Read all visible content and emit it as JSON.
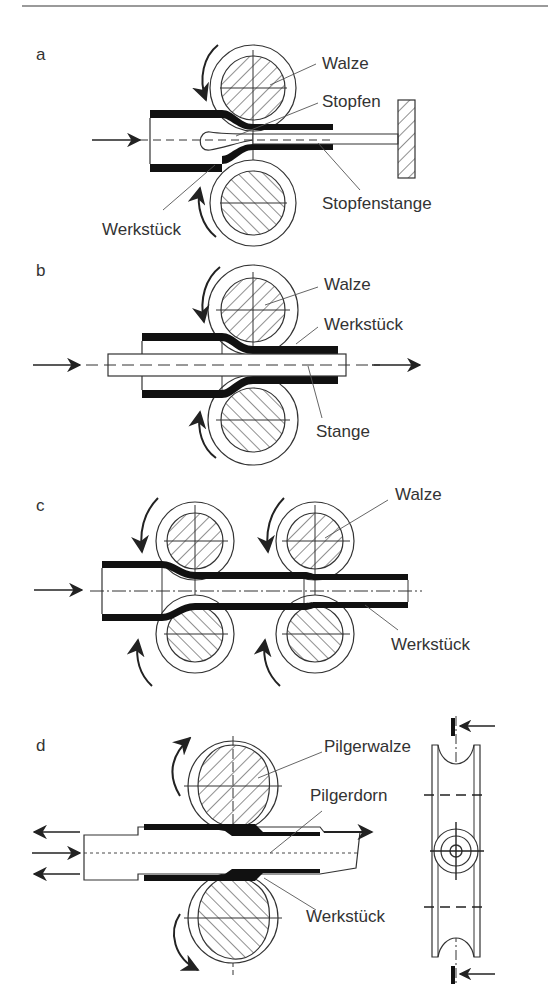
{
  "figure": {
    "panels": [
      {
        "id": "a",
        "label": "a",
        "callouts": {
          "roll": "Walze",
          "plug": "Stopfen",
          "plug_rod": "Stopfenstange",
          "workpiece": "Werkstück"
        }
      },
      {
        "id": "b",
        "label": "b",
        "callouts": {
          "roll": "Walze",
          "workpiece": "Werkstück",
          "rod": "Stange"
        }
      },
      {
        "id": "c",
        "label": "c",
        "callouts": {
          "roll": "Walze",
          "workpiece": "Werkstück"
        }
      },
      {
        "id": "d",
        "label": "d",
        "callouts": {
          "pilger_roll": "Pilgerwalze",
          "pilger_mandrel": "Pilgerdorn",
          "workpiece": "Werkstück"
        }
      }
    ],
    "colors": {
      "ink": "#222222",
      "text": "#333333",
      "rule": "#9a9a9a",
      "background": "#ffffff"
    }
  }
}
